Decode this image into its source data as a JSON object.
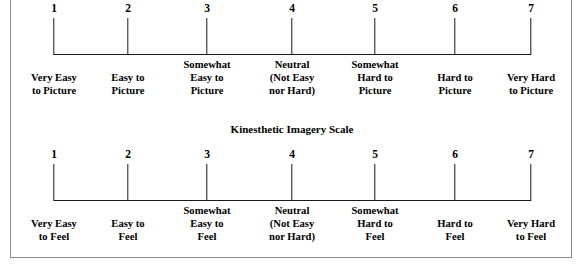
{
  "figure": {
    "background_color": "#ffffff",
    "line_color": "#1a1a1a",
    "frame_color": "#8a8a8a"
  },
  "chart_data": {
    "type": "table",
    "scales": [
      {
        "name": "visual-imagery-scale",
        "title": "",
        "points": [
          1,
          2,
          3,
          4,
          5,
          6,
          7
        ],
        "anchors": [
          "Very Easy\nto Picture",
          "Easy to\nPicture",
          "Somewhat\nEasy to\nPicture",
          "Neutral\n(Not Easy\nnor Hard)",
          "Somewhat\nHard to\nPicture",
          "Hard to\nPicture",
          "Very Hard\nto Picture"
        ]
      },
      {
        "name": "kinesthetic-imagery-scale",
        "title": "Kinesthetic Imagery Scale",
        "points": [
          1,
          2,
          3,
          4,
          5,
          6,
          7
        ],
        "anchors": [
          "Very Easy\nto Feel",
          "Easy to\nFeel",
          "Somewhat\nEasy to\nFeel",
          "Neutral\n(Not Easy\nnor Hard)",
          "Somewhat\nHard to\nFeel",
          "Hard to\nFeel",
          "Very Hard\nto Feel"
        ]
      }
    ]
  },
  "visual_scale": {
    "numbers": [
      "1",
      "2",
      "3",
      "4",
      "5",
      "6",
      "7"
    ],
    "labels": [
      {
        "lines": [
          "Very Easy",
          "to Picture"
        ]
      },
      {
        "lines": [
          "Easy to",
          "Picture"
        ]
      },
      {
        "lines": [
          "Somewhat",
          "Easy to",
          "Picture"
        ]
      },
      {
        "lines": [
          "Neutral",
          "(Not Easy",
          "nor Hard)"
        ]
      },
      {
        "lines": [
          "Somewhat",
          "Hard to",
          "Picture"
        ]
      },
      {
        "lines": [
          "Hard to",
          "Picture"
        ]
      },
      {
        "lines": [
          "Very Hard",
          "to Picture"
        ]
      }
    ]
  },
  "kinesthetic_scale": {
    "title": "Kinesthetic Imagery Scale",
    "numbers": [
      "1",
      "2",
      "3",
      "4",
      "5",
      "6",
      "7"
    ],
    "labels": [
      {
        "lines": [
          "Very Easy",
          "to Feel"
        ]
      },
      {
        "lines": [
          "Easy to",
          "Feel"
        ]
      },
      {
        "lines": [
          "Somewhat",
          "Easy to",
          "Feel"
        ]
      },
      {
        "lines": [
          "Neutral",
          "(Not Easy",
          "nor Hard)"
        ]
      },
      {
        "lines": [
          "Somewhat",
          "Hard to",
          "Feel"
        ]
      },
      {
        "lines": [
          "Hard to",
          "Feel"
        ]
      },
      {
        "lines": [
          "Very Hard",
          "to Feel"
        ]
      }
    ]
  },
  "geometry": {
    "tick_x": [
      54,
      128,
      207,
      292,
      375,
      455,
      531
    ],
    "label_x": [
      54,
      128,
      207,
      292,
      375,
      455,
      531
    ]
  }
}
